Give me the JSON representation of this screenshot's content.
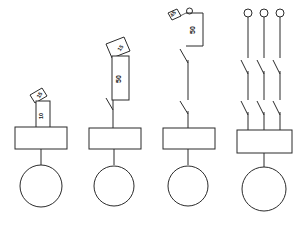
{
  "diagram": {
    "background_color": "#ffffff",
    "line_color": "#2b2b2b",
    "text_color": "#1a1a1a",
    "figures": [
      {
        "id": "figure-1",
        "name": "single-contact-small-dimension",
        "dimension_label": "10",
        "angle_label": "15",
        "coil_box": {
          "width": 50,
          "height": 22
        },
        "lamp": {
          "shape": "circle",
          "radius": 20
        },
        "contact_count": 1
      },
      {
        "id": "figure-2",
        "name": "single-contact-tall-dimension",
        "dimension_label": "50",
        "angle_label": "15",
        "coil_box": {
          "width": 50,
          "height": 20
        },
        "lamp": {
          "shape": "circle",
          "radius": 19
        },
        "contact_count": 1
      },
      {
        "id": "figure-3",
        "name": "double-contact-top-dimension",
        "dimension_label": "50",
        "angle_label": "45",
        "coil_box": {
          "width": 50,
          "height": 20
        },
        "lamp": {
          "shape": "circle",
          "radius": 19
        },
        "contact_count": 2
      },
      {
        "id": "figure-4",
        "name": "three-pole-contactor",
        "terminal_count": 3,
        "coil_box": {
          "width": 54,
          "height": 22
        },
        "lamp": {
          "shape": "circle",
          "radius": 21
        },
        "contact_count": 6
      }
    ]
  }
}
